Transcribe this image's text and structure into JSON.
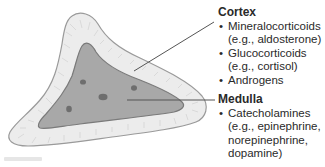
{
  "diagram": {
    "colors": {
      "cortex_fill": "#ececec",
      "cortex_outline": "#9a9a9a",
      "medulla_fill": "#a8a8a8",
      "medulla_outline": "#7a7a7a",
      "nucleus": "#6e6e6e",
      "leader_line": "#555555",
      "text": "#2a2a2a"
    }
  },
  "labels": {
    "cortex": {
      "title": "Cortex",
      "items": [
        {
          "name": "Mineralocorticoids",
          "example": "(e.g., aldosterone)"
        },
        {
          "name": "Glucocorticoids",
          "example": "(e.g., cortisol)"
        },
        {
          "name": "Androgens"
        }
      ]
    },
    "medulla": {
      "title": "Medulla",
      "items": [
        {
          "name": "Catecholamines",
          "example_lines": [
            "(e.g., epinephrine,",
            "norepinephrine,",
            "dopamine)"
          ]
        }
      ]
    }
  }
}
